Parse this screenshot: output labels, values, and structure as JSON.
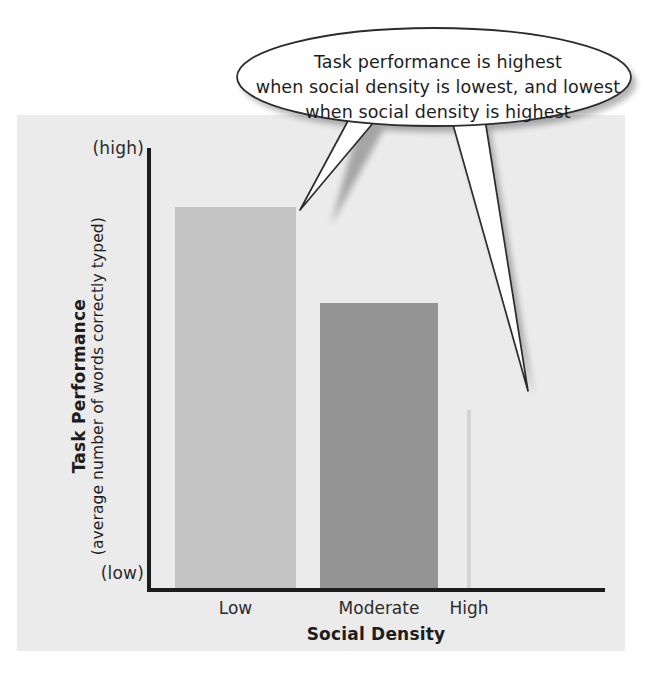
{
  "figure": {
    "background_color": "#ebebeb",
    "page_color": "#ffffff"
  },
  "callout": {
    "name": "annotation-callout",
    "lines": [
      "Task performance is highest",
      "when social density is lowest, and lowest",
      "when social density is highest"
    ],
    "fill_color": "#ffffff",
    "stroke_color": "#2b2b2b"
  },
  "axes": {
    "y_title_main": "Task Performance",
    "y_title_sub": "(average number of words correctly typed)",
    "y_tick_high": "(high)",
    "y_tick_low": "(low)",
    "x_title": "Social Density",
    "axis_color": "#1d1d1d"
  },
  "chart_data": {
    "type": "bar",
    "title": "",
    "xlabel": "Social Density",
    "ylabel": "Task Performance (average number of words correctly typed)",
    "categories": [
      "Low",
      "Moderate",
      "High"
    ],
    "values": [
      0.865,
      0.648,
      0.405
    ],
    "ytick_labels": [
      "(low)",
      "(high)"
    ],
    "ylim": [
      0,
      1
    ],
    "grid": false,
    "legend": null,
    "bar_colors": [
      "#c4c4c4",
      "#949494",
      "#d3d3d3"
    ],
    "bar_widths_px": [
      121,
      118,
      4
    ],
    "annotations": [
      "Task performance is highest when social density is lowest, and lowest when social density is highest"
    ]
  }
}
